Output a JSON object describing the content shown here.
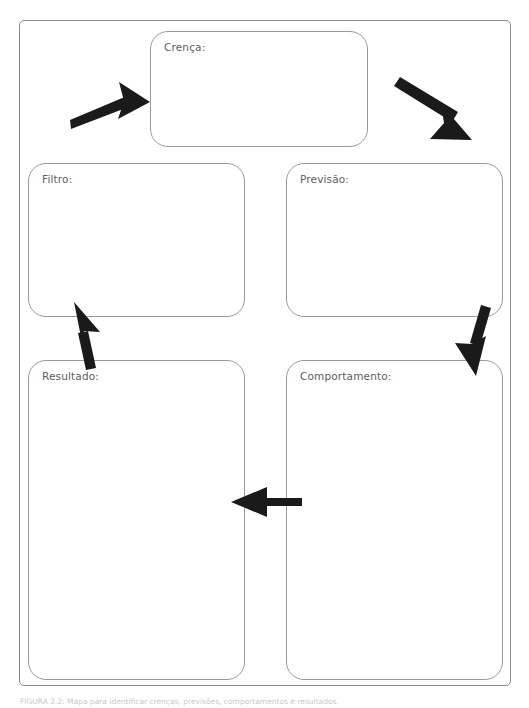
{
  "page": {
    "background_color": "#ffffff",
    "frame_border_color": "#8a8a8a",
    "box_border_color": "#9a9a9a",
    "label_color": "#5d5d5d",
    "arrow_color": "#1a1a1a"
  },
  "diagram": {
    "title": "",
    "boxes": [
      {
        "id": "crenca",
        "label": "Crença:",
        "value": ""
      },
      {
        "id": "filtro",
        "label": "Filtro:",
        "value": ""
      },
      {
        "id": "previsao",
        "label": "Previsão:",
        "value": ""
      },
      {
        "id": "resultado",
        "label": "Resultado:",
        "value": ""
      },
      {
        "id": "comportamento",
        "label": "Comportamento:",
        "value": ""
      }
    ],
    "arrows": [
      {
        "id": "arrow-to-crenca",
        "from": "filtro",
        "to": "crenca",
        "direction": "up-right"
      },
      {
        "id": "arrow-crenca-to-previsao",
        "from": "crenca",
        "to": "previsao",
        "direction": "down-right"
      },
      {
        "id": "arrow-previsao-to-comportamento",
        "from": "previsao",
        "to": "comportamento",
        "direction": "down"
      },
      {
        "id": "arrow-comportamento-to-resultado",
        "from": "comportamento",
        "to": "resultado",
        "direction": "left"
      },
      {
        "id": "arrow-resultado-to-filtro",
        "from": "resultado",
        "to": "filtro",
        "direction": "up"
      }
    ]
  },
  "caption": {
    "text": "FIGURA 2.2: Mapa para identificar crenças, previsões, comportamentos e resultados."
  }
}
